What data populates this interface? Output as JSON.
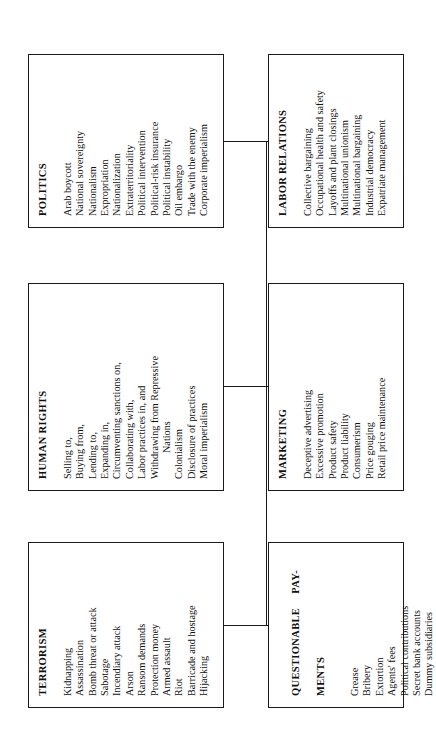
{
  "diagram": {
    "type": "taxonomy-tree",
    "orientation": "rotated-90-ccw",
    "nodes": [
      {
        "id": "terrorism",
        "title": "TERRORISM",
        "items": [
          "Kidnapping",
          "Assassination",
          "Bomb threat or attack",
          "Sabotage",
          "Incendiary attack",
          "Arson",
          "Ransom demands",
          "Protection money",
          "Armed assault",
          "Riot",
          "Barricade and hostage",
          "Hijacking"
        ]
      },
      {
        "id": "human_rights",
        "title": "HUMAN RIGHTS",
        "items": [
          "Selling to,",
          "Buying from,",
          "Lending to,",
          "Expanding in,",
          "Circumventing sanctions on,",
          "Collaborating with,",
          "Labor practices in, and",
          "Withdrawing from Repressive",
          "Nations",
          "Colonialism",
          "Disclosure of practices",
          "Moral imperialism"
        ],
        "indented_items": [
          "Nations"
        ]
      },
      {
        "id": "politics",
        "title": "POLITICS",
        "items": [
          "Arab boycott",
          "National sovereignty",
          "Nationalism",
          "Expropriation",
          "Nationalization",
          "Extraterritoriality",
          "Political intervention",
          "Political-risk insurance",
          "Political instability",
          "Oil embargo",
          "Trade with the enemy",
          "Corporate imperialism"
        ]
      },
      {
        "id": "questionable_payments",
        "title_part1": "QUESTIONABLE",
        "title_part2": "PAY-",
        "title_part3": "MENTS",
        "title": "QUESTIONABLE PAY-MENTS",
        "items": [
          "Grease",
          "Bribery",
          "Extortion",
          "Agents' fees",
          "Political contributions",
          "Secret bank accounts",
          "Dummy subsidiaries"
        ]
      },
      {
        "id": "marketing",
        "title": "MARKETING",
        "items": [
          "Deceptive advertising",
          "Excessive promotion",
          "Product safety",
          "Product liability",
          "Consumerism",
          "Price gouging",
          "Retail price maintenance"
        ]
      },
      {
        "id": "labor_relations",
        "title": "LABOR RELATIONS",
        "items": [
          "Collective bargaining",
          "Occupational health and safety",
          "Layoffs and plant closings",
          "Multinational unionism",
          "Multinational bargaining",
          "Industrial democracy",
          "Expatriate management"
        ]
      }
    ],
    "colors": {
      "line": "#1a1a1a",
      "text": "#111111",
      "background": "#ffffff"
    }
  }
}
